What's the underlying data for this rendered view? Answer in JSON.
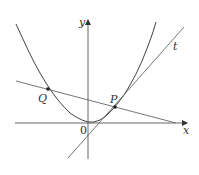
{
  "diagram": {
    "type": "function-graph",
    "colors": {
      "background": "#ffffff",
      "curve": "#444444",
      "lines": "#666666",
      "axes": "#555555",
      "text": "#333333"
    },
    "axes": {
      "x_label": "x",
      "y_label": "y",
      "origin_label": "0"
    },
    "points": [
      {
        "label": "Q",
        "role": "point on curve (left)"
      },
      {
        "label": "P",
        "role": "point of tangency"
      }
    ],
    "lines": [
      {
        "label": "",
        "role": "secant line through Q and P"
      },
      {
        "label": "t",
        "role": "tangent line at P"
      }
    ],
    "curve": {
      "label": "",
      "role": "parabola, vertex near origin"
    }
  }
}
